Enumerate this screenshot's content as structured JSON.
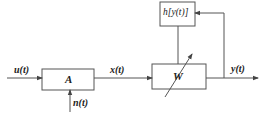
{
  "diagram": {
    "type": "block-diagram",
    "colors": {
      "line": "#555555",
      "box_border": "#555555",
      "text": "#222222",
      "background": "#ffffff"
    },
    "blocks": {
      "A": {
        "label": "A"
      },
      "W": {
        "label": "W"
      },
      "h": {
        "label": "h[y(t)]"
      }
    },
    "signals": {
      "input": "u(t)",
      "noise": "n(t)",
      "intermediate": "x(t)",
      "output": "y(t)"
    },
    "edges": [
      {
        "from": "u(t)",
        "to": "A"
      },
      {
        "from": "n(t)",
        "to": "A"
      },
      {
        "from": "A",
        "to": "W",
        "label": "x(t)"
      },
      {
        "from": "W",
        "to": "y(t)"
      },
      {
        "from": "y(t)",
        "to": "h",
        "note": "feedback"
      },
      {
        "from": "h",
        "to": "W",
        "note": "adjusts W"
      }
    ]
  }
}
